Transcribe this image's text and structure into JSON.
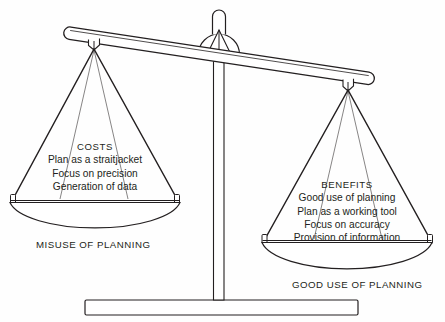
{
  "diagram": {
    "type": "balance-scale",
    "colors": {
      "background": "#fefefe",
      "stroke": "#231f20",
      "text": "#231f20",
      "fill": "#ffffff"
    },
    "tilt": "left pan raised, right pan lowered"
  },
  "left_pan": {
    "title": "COSTS",
    "items": [
      "Plan as a straitjacket",
      "Focus on precision",
      "Generation of data"
    ],
    "caption": "MISUSE OF PLANNING"
  },
  "right_pan": {
    "title": "BENEFITS",
    "items": [
      "Good use of planning",
      "Plan as a working tool",
      "Focus on accuracy",
      "Provision of information"
    ],
    "caption": "GOOD USE OF PLANNING"
  },
  "parts": {
    "beam": "beam",
    "fulcrum": "fulcrum",
    "pointer": "pointer-needle",
    "column": "center-column",
    "base": "base-plate",
    "left_strings": "left-pan-strings",
    "right_strings": "right-pan-strings",
    "left_bowl": "left-pan-bowl",
    "right_bowl": "right-pan-bowl"
  }
}
